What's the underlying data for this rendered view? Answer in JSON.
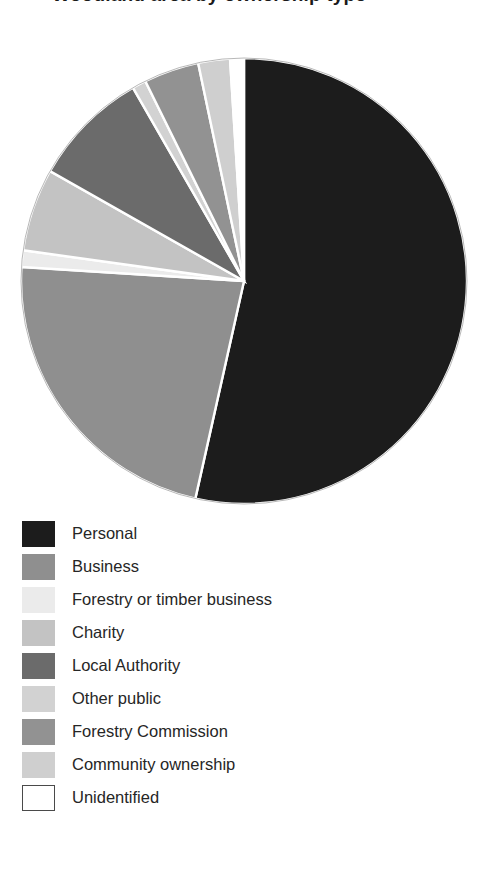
{
  "title": {
    "text": "Woodland area by ownership type",
    "clipped": true
  },
  "chart_data": {
    "type": "pie",
    "title": "Woodland area by ownership type",
    "categories": [
      "Personal",
      "Business",
      "Forestry or timber business",
      "Charity",
      "Local Authority",
      "Other public",
      "Forestry Commission",
      "Community ownership",
      "Unidentified"
    ],
    "values": [
      53.5,
      22.5,
      1.2,
      6.0,
      8.5,
      1.0,
      4.0,
      2.3,
      1.0
    ],
    "unit": "percent",
    "colors": [
      "#1c1c1c",
      "#8f8f8f",
      "#ebebeb",
      "#c3c3c3",
      "#6b6b6b",
      "#d2d2d2",
      "#929292",
      "#cfcfcf",
      "#ffffff"
    ],
    "start_angle": 0,
    "direction": "clockwise",
    "slice_border": "#ffffff",
    "legend_position": "bottom",
    "grid": false,
    "data_labels": false,
    "background": "#ffffff"
  },
  "legend": {
    "items": [
      {
        "label": "Personal",
        "color": "#1c1c1c",
        "border": "none"
      },
      {
        "label": "Business",
        "color": "#8f8f8f",
        "border": "none"
      },
      {
        "label": "Forestry or timber business",
        "color": "#ebebeb",
        "border": "none"
      },
      {
        "label": "Charity",
        "color": "#c3c3c3",
        "border": "none"
      },
      {
        "label": "Local Authority",
        "color": "#6b6b6b",
        "border": "none"
      },
      {
        "label": "Other public",
        "color": "#d2d2d2",
        "border": "none"
      },
      {
        "label": "Forestry Commission",
        "color": "#929292",
        "border": "none"
      },
      {
        "label": "Community ownership",
        "color": "#cfcfcf",
        "border": "none"
      },
      {
        "label": "Unidentified",
        "color": "#ffffff",
        "border": "#4a4a4a"
      }
    ]
  }
}
